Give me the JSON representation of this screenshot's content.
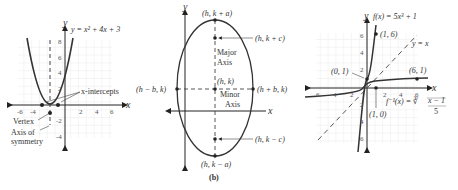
{
  "panel_a": {
    "equation": "y = x² + 4x + 3",
    "y_axis_label": "y",
    "x_axis_label": "x",
    "x_ticks": [
      "-6",
      "-4",
      "2",
      "4",
      "6"
    ],
    "y_ticks": [
      "8",
      "6",
      "4",
      "2",
      "-2",
      "-4"
    ],
    "labels": {
      "x_intercepts": "x-intercepts",
      "vertex": "Vertex",
      "axis_of_symmetry_line1": "Axis of",
      "axis_of_symmetry_line2": "symmetry"
    }
  },
  "panel_b": {
    "caption": "(b)",
    "y_axis_label": "y",
    "x_axis_label": "x",
    "points": {
      "top_vertex": "(h, k + a)",
      "top_focus": "(h, k + c)",
      "center": "(h, k)",
      "left_covertex": "(h − b, k)",
      "right_covertex": "(h + b, k)",
      "bottom_focus": "(h, k − c)",
      "bottom_vertex": "(h, k − a)"
    },
    "labels": {
      "major_axis_line1": "Major",
      "major_axis_line2": "Axis",
      "minor_axis_line1": "Minor",
      "minor_axis_line2": "Axis"
    }
  },
  "panel_c": {
    "function_label": "f(x) = 5x³ + 1",
    "inverse_label_prefix": "f⁻¹(x) = ∛",
    "inverse_numerator": "x − 1",
    "inverse_denominator": "5",
    "identity_label": "y = x",
    "y_axis_label": "y",
    "x_axis_label": "x",
    "x_ticks": [
      "6",
      "4",
      "2",
      "2",
      "4",
      "6"
    ],
    "y_ticks": [
      "6",
      "4",
      "2",
      "2",
      "4",
      "6"
    ],
    "points": {
      "p1": "(1, 6)",
      "p2": "(0, 1)",
      "p3": "(6, 1)",
      "p4": "(1, 0)"
    }
  }
}
